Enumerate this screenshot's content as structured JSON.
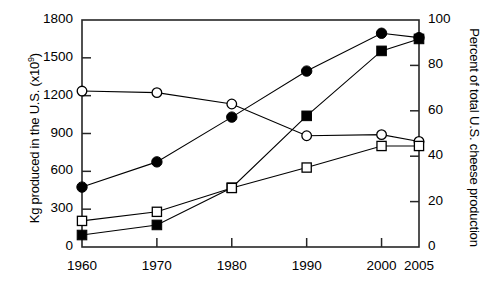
{
  "figure": {
    "width": 496,
    "height": 289,
    "background": "#ffffff",
    "line_color": "#000000",
    "marker_fill_dark": "#000000",
    "marker_fill_open": "#ffffff"
  },
  "axes": {
    "left": {
      "label_prefix": "Kg produced in the U.S. (x10",
      "label_exponent": "9",
      "label_suffix": ")",
      "label_full": "Kg produced in the U.S. (x10⁹)",
      "ticks": [
        "0",
        "300",
        "600",
        "900",
        "1200",
        "1500",
        "1800"
      ],
      "min": 0,
      "max": 1800
    },
    "right": {
      "label_full": "Percent of total U.S. cheese production",
      "ticks": [
        "0",
        "20",
        "40",
        "60",
        "80",
        "100"
      ],
      "min": 0,
      "max": 100
    },
    "bottom": {
      "ticks": [
        "1960",
        "1970",
        "1980",
        "1990",
        "2000",
        "2005"
      ],
      "min": 1960,
      "max": 2005
    }
  },
  "chart_data": {
    "type": "line",
    "title": "",
    "xlabel": "",
    "ylabel": "Kg produced in the U.S. (x10⁹)",
    "y2label": "Percent of total U.S. cheese production",
    "x": [
      1960,
      1970,
      1980,
      1990,
      2000,
      2005
    ],
    "xlim": [
      1960,
      2005
    ],
    "ylim": [
      0,
      1800
    ],
    "y2lim": [
      0,
      100
    ],
    "grid": false,
    "legend": "none",
    "series": [
      {
        "name": "Total cheese produced (filled circle)",
        "marker": "filled-circle",
        "axis": "left",
        "values": [
          475,
          675,
          1030,
          1395,
          1695,
          1660
        ]
      },
      {
        "name": "Italian-type + other cheese produced (filled square)",
        "marker": "filled-square",
        "axis": "left",
        "values": [
          95,
          175,
          470,
          1040,
          1555,
          1650
        ]
      },
      {
        "name": "Percent share declining (open circle)",
        "marker": "open-circle",
        "axis": "right",
        "values": [
          68.7,
          68.0,
          63.0,
          49.0,
          49.5,
          46.5
        ]
      },
      {
        "name": "Percent share rising (open square)",
        "marker": "open-square",
        "axis": "right",
        "values": [
          11.5,
          15.5,
          26.0,
          35.0,
          44.5,
          44.5
        ]
      }
    ]
  }
}
